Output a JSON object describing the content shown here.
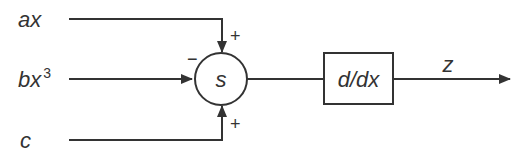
{
  "diagram": {
    "type": "block-diagram",
    "inputs": [
      {
        "label": "ax",
        "sign": "+",
        "entry": "top"
      },
      {
        "label": "bx",
        "superscript": "3",
        "sign": "−",
        "entry": "left"
      },
      {
        "label": "c",
        "sign": "+",
        "entry": "bottom"
      }
    ],
    "summing_junction": {
      "label": "s"
    },
    "block": {
      "label": "d/dx"
    },
    "output": {
      "label": "z"
    },
    "colors": {
      "stroke": "#333333",
      "background": "#ffffff"
    }
  }
}
